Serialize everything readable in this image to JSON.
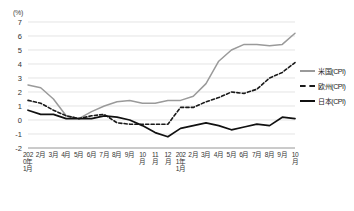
{
  "chart_data": {
    "type": "line",
    "title": "",
    "xlabel": "",
    "ylabel": "(%)",
    "unit_label": "(%)",
    "ylim": [
      -2,
      7
    ],
    "yticks": [
      7,
      6,
      5,
      4,
      3,
      2,
      1,
      0,
      -1,
      -2
    ],
    "ytick_labels": [
      "7",
      "6",
      "5",
      "4",
      "3",
      "2",
      "1",
      "0",
      "-1",
      "-2"
    ],
    "grid": true,
    "legend_position": "right",
    "categories": [
      "2020年1月",
      "2月",
      "3月",
      "4月",
      "5月",
      "6月",
      "7月",
      "8月",
      "9月",
      "10月",
      "11月",
      "12月",
      "2021年1月",
      "2月",
      "3月",
      "4月",
      "5月",
      "6月",
      "7月",
      "8月",
      "9月",
      "10月"
    ],
    "series": [
      {
        "name": "米国(CPI)",
        "color": "#9a9a9a",
        "style": "solid",
        "values": [
          2.5,
          2.3,
          1.5,
          0.3,
          0.1,
          0.6,
          1.0,
          1.3,
          1.4,
          1.2,
          1.2,
          1.4,
          1.4,
          1.7,
          2.6,
          4.2,
          5.0,
          5.4,
          5.4,
          5.3,
          5.4,
          6.2
        ]
      },
      {
        "name": "欧州(CPI)",
        "color": "#1a1a1a",
        "style": "dashed",
        "values": [
          1.4,
          1.2,
          0.7,
          0.3,
          0.1,
          0.3,
          0.4,
          -0.2,
          -0.3,
          -0.3,
          -0.3,
          -0.3,
          0.9,
          0.9,
          1.3,
          1.6,
          2.0,
          1.9,
          2.2,
          3.0,
          3.4,
          4.1
        ]
      },
      {
        "name": "日本(CPI)",
        "color": "#111111",
        "style": "solid",
        "values": [
          0.7,
          0.4,
          0.4,
          0.1,
          0.1,
          0.1,
          0.3,
          0.2,
          0.0,
          -0.4,
          -0.9,
          -1.2,
          -0.6,
          -0.4,
          -0.2,
          -0.4,
          -0.7,
          -0.5,
          -0.3,
          -0.4,
          0.2,
          0.1
        ]
      }
    ]
  },
  "legend": {
    "items": [
      {
        "label": "米国(CPI)"
      },
      {
        "label": "欧州(CPI)"
      },
      {
        "label": "日本(CPI)"
      }
    ]
  }
}
